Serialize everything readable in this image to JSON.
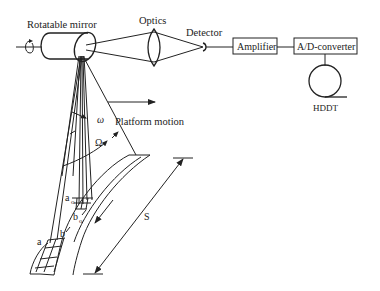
{
  "diagram": {
    "type": "airborne line-scanner schematic",
    "components": {
      "mirror": "Rotatable mirror",
      "optics": "Optics",
      "detector": "Detector",
      "amplifier": "Amplifier",
      "adc": "A/D-converter",
      "recorder": "HDDT"
    },
    "annotations": {
      "platform_motion": "Platform motion",
      "ifov": "ω",
      "fov": "Ω",
      "swath": "S",
      "a0": "a",
      "a0_sub": "o",
      "b0": "b",
      "b0_sub": "o",
      "a": "a",
      "b": "b"
    },
    "connections": [
      [
        "Rotatable mirror",
        "Optics"
      ],
      [
        "Optics",
        "Detector"
      ],
      [
        "Detector",
        "Amplifier"
      ],
      [
        "Amplifier",
        "A/D-converter"
      ],
      [
        "A/D-converter",
        "HDDT"
      ]
    ]
  }
}
